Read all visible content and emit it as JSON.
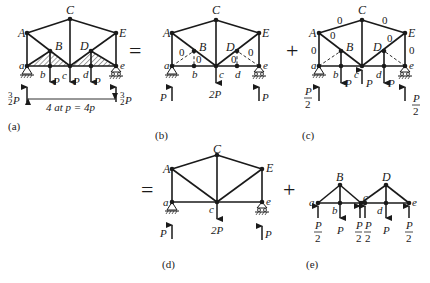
{
  "figure": {
    "operators": {
      "equals_1": "=",
      "plus_1": "+",
      "equals_2": "=",
      "plus_2": "+"
    },
    "panels": {
      "a": {
        "caption": "(a)",
        "nodes": {
          "A": "A",
          "B": "B",
          "C": "C",
          "D": "D",
          "E": "E",
          "a": "a",
          "b": "b",
          "c": "c",
          "d": "d",
          "e": "e"
        },
        "loads": {
          "b": "P",
          "c": "P",
          "d": "P"
        },
        "reactions": {
          "left_num": "3",
          "left_den": "2",
          "left_sym": "P",
          "right_num": "3",
          "right_den": "2",
          "right_sym": "P"
        },
        "dimension": "4 at p = 4p"
      },
      "b": {
        "caption": "(b)",
        "nodes": {
          "A": "A",
          "B": "B",
          "C": "C",
          "D": "D",
          "E": "E",
          "a": "a",
          "b": "b",
          "c": "c",
          "d": "d",
          "e": "e"
        },
        "zero_members": {
          "aB": "0",
          "bB": "0",
          "dD": "0",
          "eD": "0"
        },
        "loads": {
          "c": "2P"
        },
        "reactions": {
          "left": "P",
          "right": "P"
        }
      },
      "c": {
        "caption": "(c)",
        "nodes": {
          "A": "A",
          "B": "B",
          "C": "C",
          "D": "D",
          "E": "E",
          "a": "a",
          "b": "b",
          "c": "c",
          "d": "d",
          "e": "e"
        },
        "zero_members": {
          "AC": "0",
          "CE": "0",
          "AB": "0",
          "DE": "0",
          "aA": "0",
          "eE": "0"
        },
        "loads": {
          "b": "P",
          "c": "P",
          "d": "P"
        },
        "reactions": {
          "left_num": "P",
          "left_den": "2",
          "right_num": "P",
          "right_den": "2"
        }
      },
      "d": {
        "caption": "(d)",
        "nodes": {
          "A": "A",
          "C": "C",
          "E": "E",
          "a": "a",
          "c": "c",
          "e": "e"
        },
        "loads": {
          "c": "2P"
        },
        "reactions": {
          "left": "P",
          "right": "P"
        }
      },
      "e": {
        "caption": "(e)",
        "nodes": {
          "B": "B",
          "D": "D",
          "a": "a",
          "b": "b",
          "c": "c",
          "d": "d",
          "e": "e"
        },
        "loads": {
          "b": "P",
          "d": "P"
        },
        "forces": {
          "a_num": "P",
          "a_den": "2",
          "c1_num": "P",
          "c1_den": "2",
          "c2_num": "P",
          "c2_den": "2",
          "e_num": "P",
          "e_den": "2"
        }
      }
    }
  }
}
